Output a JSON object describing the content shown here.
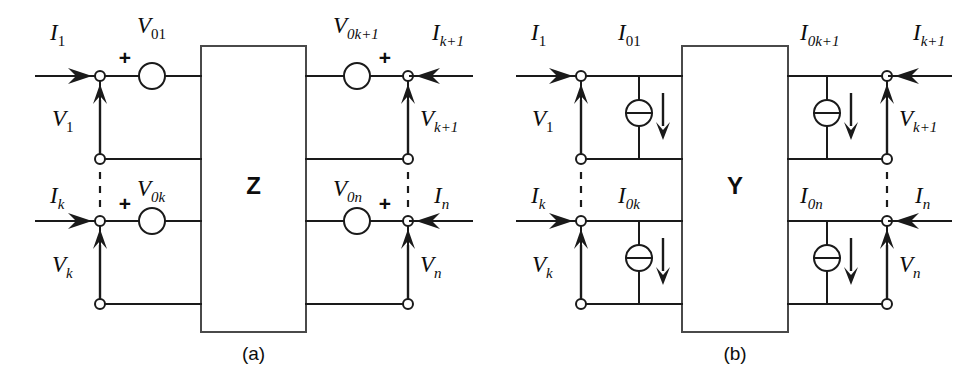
{
  "figure": {
    "background_color": "#ffffff",
    "line_color": "#1a1a1a",
    "box_stroke_color": "#4a4a4a"
  },
  "panels": [
    {
      "id": "a",
      "caption": "(a)",
      "box_label": "Z",
      "box_label_meaning": "impedance-matrix-block",
      "source_type": "voltage-source",
      "source_polarity_marks": [
        "+",
        "+",
        "+",
        "+"
      ],
      "ports": [
        {
          "name": "port-1",
          "current_label": "I",
          "current_sub": "1",
          "voltage_label": "V",
          "voltage_sub": "1",
          "source_label": "V",
          "source_sub": "01",
          "polarity": "+",
          "side": "left",
          "row": "top"
        },
        {
          "name": "port-k",
          "current_label": "I",
          "current_sub": "k",
          "voltage_label": "V",
          "voltage_sub": "k",
          "source_label": "V",
          "source_sub": "0k",
          "polarity": "+",
          "side": "left",
          "row": "bottom"
        },
        {
          "name": "port-k-plus-1",
          "current_label": "I",
          "current_sub": "k+1",
          "voltage_label": "V",
          "voltage_sub": "k+1",
          "source_label": "V",
          "source_sub": "0k+1",
          "polarity": "+",
          "side": "right",
          "row": "top"
        },
        {
          "name": "port-n",
          "current_label": "I",
          "current_sub": "n",
          "voltage_label": "V",
          "voltage_sub": "n",
          "source_label": "V",
          "source_sub": "0n",
          "polarity": "+",
          "side": "right",
          "row": "bottom"
        }
      ]
    },
    {
      "id": "b",
      "caption": "(b)",
      "box_label": "Y",
      "box_label_meaning": "admittance-matrix-block",
      "source_type": "current-source",
      "source_polarity_marks": [],
      "ports": [
        {
          "name": "port-1",
          "current_label": "I",
          "current_sub": "1",
          "voltage_label": "V",
          "voltage_sub": "1",
          "source_label": "I",
          "source_sub": "01",
          "polarity": "",
          "side": "left",
          "row": "top"
        },
        {
          "name": "port-k",
          "current_label": "I",
          "current_sub": "k",
          "voltage_label": "V",
          "voltage_sub": "k",
          "source_label": "I",
          "source_sub": "0k",
          "polarity": "",
          "side": "left",
          "row": "bottom"
        },
        {
          "name": "port-k-plus-1",
          "current_label": "I",
          "current_sub": "k+1",
          "voltage_label": "V",
          "voltage_sub": "k+1",
          "source_label": "I",
          "source_sub": "0k+1",
          "polarity": "",
          "side": "right",
          "row": "top"
        },
        {
          "name": "port-n",
          "current_label": "I",
          "current_sub": "n",
          "voltage_label": "V",
          "voltage_sub": "n",
          "source_label": "I",
          "source_sub": "0n",
          "polarity": "",
          "side": "right",
          "row": "bottom"
        }
      ]
    }
  ]
}
